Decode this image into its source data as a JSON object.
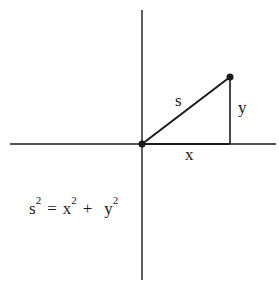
{
  "diagram": {
    "title": "",
    "labels": {
      "hypotenuse": "s",
      "vertical_leg": "y",
      "horizontal_leg": "x"
    },
    "equation": {
      "lhs_base": "s",
      "lhs_exp": "2",
      "equals": "=",
      "term1_base": "x",
      "term1_exp": "2",
      "plus": "+",
      "term2_base": "y",
      "term2_exp": "2"
    },
    "points": {
      "origin": {
        "x": 142,
        "y": 144
      },
      "apex": {
        "x": 230,
        "y": 77
      }
    },
    "colors": {
      "stroke": "#1a1a1a",
      "background": "#ffffff"
    }
  }
}
